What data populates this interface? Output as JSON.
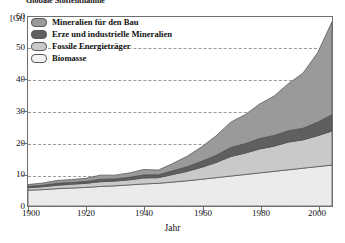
{
  "title": "Globale Stoffentnahme",
  "axes": {
    "y_unit": "[Gt]",
    "y_ticks": [
      0,
      10,
      20,
      30,
      40,
      50,
      60
    ],
    "x_title": "Jahr",
    "x_ticks": [
      1900,
      1920,
      1940,
      1960,
      1980,
      2000
    ]
  },
  "legend": {
    "items": [
      {
        "label": "Mineralien für den Bau",
        "color": "#9a9a9a"
      },
      {
        "label": "Erze und industrielle Mineralien",
        "color": "#5f5f5f"
      },
      {
        "label": "Fossile Energieträger",
        "color": "#c9c9c9"
      },
      {
        "label": "Biomasse",
        "color": "#ebebeb"
      }
    ]
  },
  "chart_data": {
    "type": "area",
    "stacked": true,
    "title": "Globale Stoffentnahme",
    "xlabel": "Jahr",
    "ylabel": "[Gt]",
    "xlim": [
      1900,
      2005
    ],
    "ylim": [
      0,
      60
    ],
    "grid": true,
    "legend_position": "top-left",
    "x": [
      1900,
      1905,
      1910,
      1915,
      1920,
      1925,
      1930,
      1935,
      1940,
      1945,
      1950,
      1955,
      1960,
      1965,
      1970,
      1975,
      1980,
      1985,
      1990,
      1995,
      2000,
      2005
    ],
    "series": [
      {
        "name": "Biomasse",
        "color": "#ebebeb",
        "values": [
          5.0,
          5.2,
          5.5,
          5.7,
          5.9,
          6.2,
          6.4,
          6.7,
          7.0,
          7.2,
          7.6,
          8.0,
          8.5,
          9.0,
          9.5,
          10.0,
          10.5,
          11.0,
          11.5,
          12.0,
          12.5,
          13.0
        ]
      },
      {
        "name": "Fossile Energieträger",
        "color": "#c9c9c9",
        "values": [
          0.8,
          0.9,
          1.1,
          1.2,
          1.3,
          1.5,
          1.5,
          1.6,
          1.9,
          1.8,
          2.4,
          3.0,
          3.8,
          4.8,
          6.2,
          6.8,
          7.6,
          8.0,
          8.8,
          9.0,
          9.8,
          10.8
        ]
      },
      {
        "name": "Erze und industrielle Mineralien",
        "color": "#5f5f5f",
        "values": [
          0.4,
          0.5,
          0.6,
          0.6,
          0.6,
          0.8,
          0.7,
          0.8,
          1.0,
          0.9,
          1.2,
          1.5,
          1.9,
          2.3,
          2.9,
          3.0,
          3.3,
          3.4,
          3.6,
          3.7,
          4.3,
          5.2
        ]
      },
      {
        "name": "Mineralien für den Bau",
        "color": "#9a9a9a",
        "values": [
          0.6,
          0.7,
          0.9,
          0.9,
          1.0,
          1.3,
          1.2,
          1.4,
          1.7,
          1.5,
          2.3,
          3.3,
          4.6,
          6.2,
          8.0,
          9.2,
          11.0,
          12.5,
          15.0,
          17.5,
          22.0,
          29.5
        ]
      }
    ],
    "totals": [
      6.8,
      7.3,
      8.1,
      8.4,
      8.8,
      9.8,
      9.8,
      10.5,
      11.6,
      11.4,
      13.5,
      15.8,
      18.8,
      22.3,
      26.6,
      29.0,
      32.4,
      34.9,
      38.9,
      42.2,
      48.6,
      58.5
    ]
  }
}
